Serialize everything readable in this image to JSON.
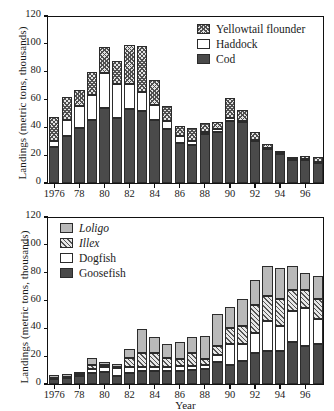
{
  "figure": {
    "ylabel": "Landings (metric tons, thousands)",
    "xlabel": "Year"
  },
  "chart_data": [
    {
      "type": "bar",
      "stacked": true,
      "panel": "top",
      "title": "",
      "xlabel": "",
      "ylabel": "Landings (metric tons, thousands)",
      "ylim": [
        0,
        120
      ],
      "yticks": [
        0,
        20,
        40,
        60,
        80,
        100,
        120
      ],
      "xticks": [
        "1976",
        "78",
        "80",
        "82",
        "84",
        "86",
        "88",
        "90",
        "92",
        "94",
        "96"
      ],
      "grid": false,
      "legend_position": "top-right",
      "categories": [
        1976,
        1977,
        1978,
        1979,
        1980,
        1981,
        1982,
        1983,
        1984,
        1985,
        1986,
        1987,
        1988,
        1989,
        1990,
        1991,
        1992,
        1993,
        1994,
        1995,
        1996,
        1997
      ],
      "series": [
        {
          "name": "Cod",
          "fill": "dark",
          "values": [
            26,
            34,
            39.5,
            45,
            54,
            47,
            53.5,
            51.5,
            45,
            38.5,
            29,
            27.5,
            35,
            37,
            44.5,
            43.5,
            30,
            24.5,
            21,
            16.5,
            16.5,
            14.5
          ]
        },
        {
          "name": "Haddock",
          "fill": "white",
          "values": [
            4,
            11,
            16,
            18.5,
            25,
            24.5,
            17.5,
            14,
            11,
            6,
            4.5,
            2.5,
            1.5,
            1.5,
            2,
            1,
            1,
            0.5,
            0.5,
            0.5,
            0.5,
            0.5
          ]
        },
        {
          "name": "Yellowtail flounder",
          "fill": "check",
          "values": [
            17.5,
            16.5,
            11.5,
            16,
            19,
            16,
            28,
            33,
            18,
            11,
            7.5,
            9.5,
            6.5,
            5,
            14.5,
            8,
            6,
            3,
            1.5,
            0.5,
            2.5,
            4
          ]
        }
      ],
      "totals": [
        47.5,
        61.5,
        67,
        79.5,
        98,
        87.5,
        99,
        98.5,
        74,
        56,
        41,
        39.5,
        43,
        43.5,
        61,
        52.5,
        37,
        28,
        23,
        17.5,
        19.5,
        19
      ]
    },
    {
      "type": "bar",
      "stacked": true,
      "panel": "bottom",
      "title": "",
      "xlabel": "Year",
      "ylabel": "Landings (metric tons, thousands)",
      "ylim": [
        0,
        120
      ],
      "yticks": [
        0,
        20,
        40,
        60,
        80,
        100,
        120
      ],
      "xticks": [
        "1976",
        "78",
        "80",
        "82",
        "84",
        "86",
        "88",
        "90",
        "92",
        "94",
        "96"
      ],
      "grid": false,
      "legend_position": "top-left",
      "categories": [
        1976,
        1977,
        1978,
        1979,
        1980,
        1981,
        1982,
        1983,
        1984,
        1985,
        1986,
        1987,
        1988,
        1989,
        1990,
        1991,
        1992,
        1993,
        1994,
        1995,
        1996,
        1997
      ],
      "series": [
        {
          "name": "Goosefish",
          "fill": "dark",
          "values": [
            3.5,
            4,
            6,
            8,
            8.5,
            6,
            8,
            9,
            9,
            9.5,
            9.5,
            10,
            10.5,
            16,
            14,
            16.5,
            22,
            24,
            24,
            30,
            27.5,
            29
          ]
        },
        {
          "name": "Dogfish",
          "fill": "white",
          "values": [
            0.5,
            0.5,
            0.5,
            3,
            4,
            5.5,
            4.5,
            3.5,
            3.5,
            3,
            3.5,
            3,
            3.5,
            4.5,
            14.5,
            12.5,
            15,
            21.5,
            18,
            22.5,
            27,
            18
          ]
        },
        {
          "name": "Illex",
          "fill": "hatch",
          "values": [
            0.5,
            0.5,
            0.5,
            3,
            1.5,
            1,
            6.5,
            9.5,
            10,
            6,
            5,
            9,
            4,
            6.5,
            11.5,
            13,
            20,
            17.5,
            19,
            15,
            13,
            14
          ]
        },
        {
          "name": "Loligo",
          "fill": "gray",
          "values": [
            2,
            2,
            0.5,
            4.5,
            2,
            2,
            6,
            17.5,
            11.5,
            10,
            12,
            12,
            16.5,
            23.5,
            15.5,
            19,
            18,
            22,
            22.5,
            17,
            12.5,
            16.5
          ]
        }
      ],
      "totals": [
        6.5,
        7,
        7.5,
        18.5,
        16,
        14.5,
        25,
        39.5,
        34,
        28.5,
        30,
        34,
        34.5,
        50.5,
        55.5,
        61,
        75,
        85,
        83.5,
        84.5,
        80,
        77.5
      ]
    }
  ],
  "legend_top": {
    "items": [
      {
        "label": "Yellowtail flounder",
        "fill": "check",
        "italic": false
      },
      {
        "label": "Haddock",
        "fill": "white",
        "italic": false
      },
      {
        "label": "Cod",
        "fill": "dark",
        "italic": false
      }
    ]
  },
  "legend_bottom": {
    "items": [
      {
        "label": "Loligo",
        "fill": "gray",
        "italic": true
      },
      {
        "label": "Illex",
        "fill": "hatch",
        "italic": true
      },
      {
        "label": "Dogfish",
        "fill": "white",
        "italic": false
      },
      {
        "label": "Goosefish",
        "fill": "dark",
        "italic": false
      }
    ]
  },
  "colors": {
    "dark": "#4a4a4a",
    "gray": "#b9b9b9",
    "white": "#ffffff",
    "hatch": "#e8e8e8",
    "check": "#e4e4e4",
    "axis": "#111111"
  }
}
